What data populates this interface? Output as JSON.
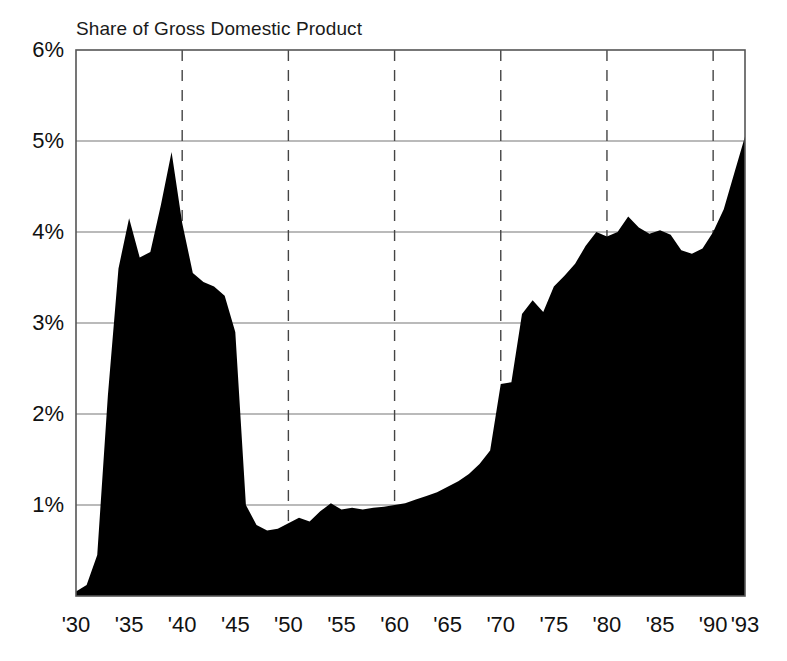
{
  "chart_data": {
    "type": "area",
    "title": "Share of Gross Domestic Product",
    "xlabel": "",
    "ylabel": "",
    "grid": true,
    "legend": "none",
    "fill_color": "#000000",
    "xlim": [
      1930,
      1993
    ],
    "ylim": [
      0,
      6
    ],
    "ytick_labels": [
      "1%",
      "2%",
      "3%",
      "4%",
      "5%",
      "6%"
    ],
    "ytick_values": [
      1,
      2,
      3,
      4,
      5,
      6
    ],
    "xtick_labels": [
      "'30",
      "'35",
      "'40",
      "'45",
      "'50",
      "'55",
      "'60",
      "'65",
      "'70",
      "'75",
      "'80",
      "'85",
      "'90",
      "'93"
    ],
    "xtick_values": [
      1930,
      1935,
      1940,
      1945,
      1950,
      1955,
      1960,
      1965,
      1970,
      1975,
      1980,
      1985,
      1990,
      1993
    ],
    "dashed_gridline_years": [
      1940,
      1950,
      1960,
      1970,
      1980,
      1990
    ],
    "x": [
      1930,
      1931,
      1932,
      1933,
      1934,
      1935,
      1936,
      1937,
      1938,
      1939,
      1940,
      1941,
      1942,
      1943,
      1944,
      1945,
      1946,
      1947,
      1948,
      1949,
      1950,
      1951,
      1952,
      1953,
      1954,
      1955,
      1956,
      1957,
      1958,
      1959,
      1960,
      1961,
      1962,
      1963,
      1964,
      1965,
      1966,
      1967,
      1968,
      1969,
      1970,
      1971,
      1972,
      1973,
      1974,
      1975,
      1976,
      1977,
      1978,
      1979,
      1980,
      1981,
      1982,
      1983,
      1984,
      1985,
      1986,
      1987,
      1988,
      1989,
      1990,
      1991,
      1992,
      1993
    ],
    "values": [
      0.05,
      0.12,
      0.45,
      2.2,
      3.6,
      4.15,
      3.72,
      3.78,
      4.3,
      4.88,
      4.1,
      3.55,
      3.45,
      3.4,
      3.3,
      2.9,
      1.0,
      0.78,
      0.72,
      0.74,
      0.8,
      0.86,
      0.82,
      0.93,
      1.02,
      0.95,
      0.97,
      0.95,
      0.97,
      0.98,
      1.0,
      1.02,
      1.06,
      1.1,
      1.14,
      1.2,
      1.26,
      1.34,
      1.45,
      1.6,
      2.33,
      2.35,
      3.1,
      3.25,
      3.12,
      3.4,
      3.52,
      3.65,
      3.85,
      4.0,
      3.95,
      4.0,
      4.17,
      4.05,
      3.98,
      4.02,
      3.97,
      3.8,
      3.76,
      3.82,
      4.0,
      4.25,
      4.65,
      5.05
    ],
    "notes": {
      "peak_1939": 4.88,
      "trough_1944": 0.72,
      "final_1993": 5.05
    }
  },
  "axes": {
    "plot_left": 76,
    "plot_right": 745,
    "plot_top": 50,
    "plot_bottom": 596
  }
}
